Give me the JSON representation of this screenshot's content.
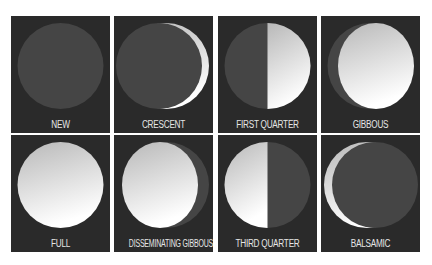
{
  "colors": {
    "panel_bg": "#2a2a2a",
    "moon_dark": "#454545",
    "moon_lit_top": "#bdbdbd",
    "moon_lit_bottom": "#ffffff",
    "label": "#e6e6e6"
  },
  "phases": [
    {
      "label": "NEW"
    },
    {
      "label": "CRESCENT"
    },
    {
      "label": "FIRST QUARTER"
    },
    {
      "label": "GIBBOUS"
    },
    {
      "label": "FULL"
    },
    {
      "label": "DISSEMINATING GIBBOUS"
    },
    {
      "label": "THIRD QUARTER"
    },
    {
      "label": "BALSAMIC"
    }
  ]
}
